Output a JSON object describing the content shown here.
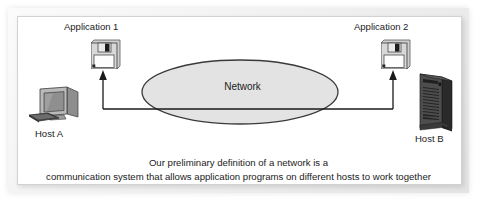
{
  "figure": {
    "background_color": "#ffffff",
    "panel_color": "#ffffff",
    "frame_color": "#e4e4e4"
  },
  "nodes": {
    "app1": {
      "label": "Application 1",
      "icon": "floppy-disk-icon"
    },
    "app2": {
      "label": "Application 2",
      "icon": "floppy-disk-icon"
    },
    "hostA": {
      "label": "Host A",
      "icon": "desktop-computer-icon"
    },
    "hostB": {
      "label": "Host B",
      "icon": "tower-server-icon"
    },
    "network": {
      "label": "Network",
      "shape": "ellipse",
      "fill_color": "#e3e3e3",
      "stroke_color": "#3a3a3a"
    }
  },
  "connectors": {
    "stroke_color": "#1a1a1a",
    "left_arrow": "arrow-up-icon",
    "right_arrow": "arrow-up-icon"
  },
  "caption": {
    "line1": "Our preliminary definition of a network is a",
    "line2": "communication system that allows application programs on different hosts to work together"
  }
}
